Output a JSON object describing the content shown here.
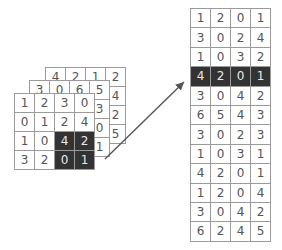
{
  "diagram": {
    "colors": {
      "highlight": "#333333",
      "highlight_text": "#e8e8e8",
      "grid_line": "#9a9a9a",
      "text": "#555555",
      "arrow": "#555555"
    },
    "back_grid": {
      "rows": [
        [
          "",
          "4",
          "2",
          "1",
          "2"
        ],
        [
          "",
          "",
          "",
          "",
          "4"
        ],
        [
          "",
          "",
          "",
          "",
          "2"
        ],
        [
          "",
          "",
          "",
          "",
          "5"
        ]
      ]
    },
    "middle_grid": {
      "rows": [
        [
          "3",
          "0",
          "6",
          "5"
        ],
        [
          "",
          "",
          "",
          "3"
        ],
        [
          "",
          "",
          "",
          "0"
        ],
        [
          "",
          "",
          "",
          "1"
        ]
      ]
    },
    "front_grid": {
      "rows": [
        [
          "1",
          "2",
          "3",
          "0"
        ],
        [
          "0",
          "1",
          "2",
          "4"
        ],
        [
          "1",
          "0",
          "4",
          "2"
        ],
        [
          "3",
          "2",
          "0",
          "1"
        ]
      ],
      "highlighted_cells": [
        [
          2,
          2
        ],
        [
          2,
          3
        ],
        [
          3,
          2
        ],
        [
          3,
          3
        ]
      ]
    },
    "output_table": {
      "rows": [
        [
          "1",
          "2",
          "0",
          "1"
        ],
        [
          "3",
          "0",
          "2",
          "4"
        ],
        [
          "1",
          "0",
          "3",
          "2"
        ],
        [
          "4",
          "2",
          "0",
          "1"
        ],
        [
          "3",
          "0",
          "4",
          "2"
        ],
        [
          "6",
          "5",
          "4",
          "3"
        ],
        [
          "3",
          "0",
          "2",
          "3"
        ],
        [
          "1",
          "0",
          "3",
          "1"
        ],
        [
          "4",
          "2",
          "0",
          "1"
        ],
        [
          "1",
          "2",
          "0",
          "4"
        ],
        [
          "3",
          "0",
          "4",
          "2"
        ],
        [
          "6",
          "2",
          "4",
          "5"
        ]
      ],
      "highlighted_row": 3
    }
  }
}
